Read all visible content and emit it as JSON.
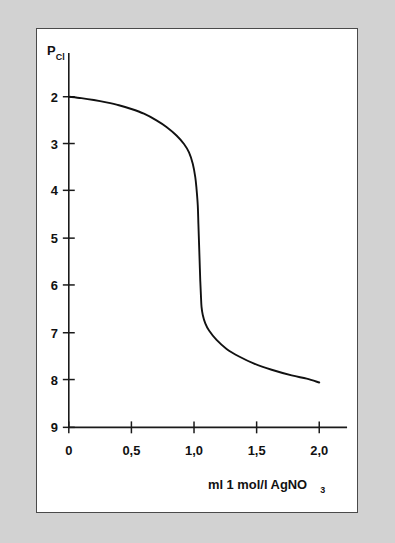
{
  "figure": {
    "background_color": "#d2d2d2",
    "panel_color": "#ffffff",
    "border_color": "#4a4a4a",
    "curve_color": "#111111"
  },
  "chart_data": {
    "type": "line",
    "title": "",
    "subtitle": "",
    "xlabel": "ml 1 mol/l AgNO3",
    "xlabel_main": "ml 1 mol/l AgNO",
    "xlabel_sub": "3",
    "ylabel": "pCl",
    "ylabel_main": "P",
    "ylabel_sub": "Cl",
    "xlim": [
      0,
      2.2
    ],
    "ylim": [
      2,
      9
    ],
    "y_inverted": true,
    "grid": false,
    "legend": null,
    "xticks": [
      0,
      0.5,
      1.0,
      1.5,
      2.0
    ],
    "xticklabels": [
      "0",
      "0,5",
      "1,0",
      "1,5",
      "2,0"
    ],
    "yticks": [
      2,
      3,
      4,
      5,
      6,
      7,
      8,
      9
    ],
    "yticklabels": [
      "2",
      "3",
      "4",
      "5",
      "6",
      "7",
      "8",
      "9"
    ],
    "series": [
      {
        "name": "titration curve",
        "x": [
          0.0,
          0.1,
          0.2,
          0.3,
          0.4,
          0.5,
          0.6,
          0.7,
          0.78,
          0.86,
          0.92,
          0.96,
          0.99,
          1.01,
          1.02,
          1.03,
          1.035,
          1.04,
          1.045,
          1.05,
          1.055,
          1.06,
          1.07,
          1.09,
          1.12,
          1.18,
          1.26,
          1.36,
          1.48,
          1.62,
          1.78,
          1.9,
          2.0
        ],
        "y": [
          2.0,
          2.03,
          2.07,
          2.12,
          2.18,
          2.26,
          2.36,
          2.5,
          2.64,
          2.82,
          3.0,
          3.18,
          3.42,
          3.7,
          3.95,
          4.3,
          4.7,
          5.1,
          5.5,
          5.9,
          6.2,
          6.45,
          6.62,
          6.8,
          6.95,
          7.15,
          7.34,
          7.5,
          7.65,
          7.78,
          7.9,
          7.97,
          8.05
        ]
      }
    ],
    "annotations": [
      {
        "text": "equivalence point",
        "x": 1.05,
        "y": 5.2,
        "visible": false
      }
    ]
  }
}
